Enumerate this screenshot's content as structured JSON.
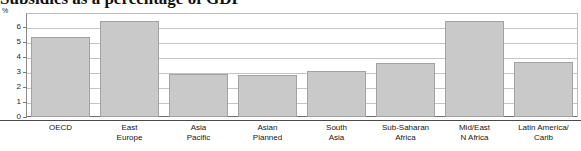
{
  "chart_data": {
    "type": "bar",
    "title": "Subsidies as a percentage of GDP",
    "title_clipped": true,
    "subtitle": "",
    "xlabel": "",
    "ylabel": "%",
    "unit_label": "%",
    "ylim": [
      0,
      6.9
    ],
    "yticks": [
      0,
      1,
      2,
      3,
      4,
      5,
      6
    ],
    "ytick_labels": [
      "0",
      "1",
      "2",
      "3",
      "4",
      "5",
      "6"
    ],
    "grid": true,
    "legend": "none",
    "categories": [
      "OECD",
      "East Europe",
      "Asia Pacific",
      "Asian Planned",
      "South Asia",
      "Sub-Saharan Africa",
      "Mid/East N Africa",
      "Latin America/ Carib"
    ],
    "category_lines": [
      [
        "OECD",
        ""
      ],
      [
        "East",
        "Europe"
      ],
      [
        "Asia",
        "Pacific"
      ],
      [
        "Asian",
        "Planned"
      ],
      [
        "South",
        "Asia"
      ],
      [
        "Sub-Saharan",
        "Africa"
      ],
      [
        "Mid/East",
        "N Africa"
      ],
      [
        "Latin America/",
        "Carib"
      ]
    ],
    "values": [
      5.3,
      6.35,
      2.85,
      2.8,
      3.05,
      3.6,
      6.4,
      3.65
    ],
    "bar_color": "#c9c9c9",
    "bar_border_color": "#a2a2a2",
    "gridline_color": "#c4c4c4",
    "axis_color": "#8a8a8a"
  }
}
